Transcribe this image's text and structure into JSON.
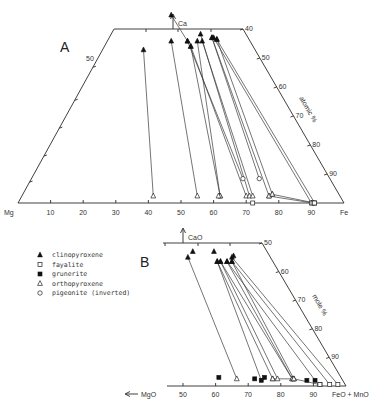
{
  "panelA": {
    "label": "A",
    "apex_label": "Ca",
    "left_label": "Mg",
    "right_label": "Fe",
    "axis_title": "atomic %",
    "bottom_ticks": [
      "10",
      "20",
      "30",
      "40",
      "50",
      "60",
      "70",
      "80",
      "90"
    ],
    "bottom_tick_values": [
      10,
      20,
      30,
      40,
      50,
      60,
      70,
      80,
      90
    ],
    "left_tick_label": "50",
    "right_ticks": [
      "40",
      "50",
      "60",
      "70",
      "80",
      "90"
    ],
    "right_tick_values": [
      40,
      50,
      60,
      70,
      80,
      90
    ],
    "tielines": [
      {
        "from": {
          "type": "clinopyroxene",
          "fe": 38.5,
          "ca": 44
        },
        "to": {
          "type": "orthopyroxene",
          "fe": 41.5,
          "ca": 2
        }
      },
      {
        "from": {
          "type": "clinopyroxene",
          "fe": 47,
          "ca": 46.5
        },
        "to": {
          "type": "orthopyroxene",
          "fe": 55,
          "ca": 2
        }
      },
      {
        "from": {
          "type": "clinopyroxene",
          "fe": 47,
          "ca": 54
        },
        "to": {
          "type": "clinopyroxene",
          "fe": 52,
          "ca": 46.5
        }
      },
      {
        "from": {
          "type": "clinopyroxene",
          "fe": 52,
          "ca": 46.5
        },
        "to": {
          "type": "pigeonite",
          "fe": 69,
          "ca": 7
        }
      },
      {
        "from": {
          "type": "clinopyroxene",
          "fe": 53,
          "ca": 45
        },
        "to": {
          "type": "orthopyroxene",
          "fe": 62,
          "ca": 2
        }
      },
      {
        "from": {
          "type": "clinopyroxene",
          "fe": 53,
          "ca": 45
        },
        "to": {
          "type": "orthopyroxene",
          "fe": 70,
          "ca": 2
        }
      },
      {
        "from": {
          "type": "clinopyroxene",
          "fe": 56,
          "ca": 48.5
        },
        "to": {
          "type": "orthopyroxene",
          "fe": 71,
          "ca": 2
        }
      },
      {
        "from": {
          "type": "clinopyroxene",
          "fe": 55,
          "ca": 46.5
        },
        "to": {
          "type": "orthopyroxene",
          "fe": 62,
          "ca": 2
        }
      },
      {
        "from": {
          "type": "clinopyroxene",
          "fe": 56.5,
          "ca": 46.5
        },
        "to": {
          "type": "orthopyroxene",
          "fe": 72,
          "ca": 2
        }
      },
      {
        "from": {
          "type": "clinopyroxene",
          "fe": 59.5,
          "ca": 47.5
        },
        "to": {
          "type": "pigeonite",
          "fe": 74,
          "ca": 7
        }
      },
      {
        "from": {
          "type": "clinopyroxene",
          "fe": 59.5,
          "ca": 47.5
        },
        "to": {
          "type": "orthopyroxene",
          "fe": 77,
          "ca": 2
        }
      },
      {
        "from": {
          "type": "clinopyroxene",
          "fe": 61,
          "ca": 47
        },
        "to": {
          "type": "orthopyroxene",
          "fe": 78,
          "ca": 2.5
        }
      },
      {
        "from": {
          "type": "clinopyroxene",
          "fe": 61,
          "ca": 47
        },
        "to": {
          "type": "fayalite",
          "fe": 91,
          "ca": 0
        }
      },
      {
        "from": {
          "type": "clinopyroxene",
          "fe": 60,
          "ca": 47.5
        },
        "to": {
          "type": "fayalite",
          "fe": 90,
          "ca": 0
        }
      },
      {
        "from": {
          "type": "orthopyroxene",
          "fe": 77,
          "ca": 2
        },
        "to": {
          "type": "fayalite",
          "fe": 90.5,
          "ca": 0
        }
      },
      {
        "from": {
          "type": "orthopyroxene",
          "fe": 78,
          "ca": 2.5
        },
        "to": {
          "type": "fayalite",
          "fe": 91,
          "ca": 0
        }
      }
    ],
    "extra_points": [
      {
        "type": "orthopyroxene",
        "fe": 61.5,
        "ca": 2
      },
      {
        "type": "fayalite",
        "fe": 72,
        "ca": 0
      }
    ]
  },
  "panelB": {
    "label": "B",
    "apex_label": "CaO",
    "left_label": "MgO",
    "right_label": "FeO + MnO",
    "axis_title": "mole %",
    "bottom_ticks": [
      "50",
      "60",
      "70",
      "80",
      "90"
    ],
    "bottom_tick_values": [
      50,
      60,
      70,
      80,
      90
    ],
    "right_ticks": [
      "50",
      "60",
      "70",
      "80",
      "90"
    ],
    "right_tick_values": [
      50,
      60,
      70,
      80,
      90
    ],
    "tielines": [
      {
        "from": {
          "type": "clinopyroxene",
          "fe": 51.5,
          "ca": 45
        },
        "to": {
          "type": "orthopyroxene",
          "fe": 66.5,
          "ca": 2.5
        }
      },
      {
        "from": {
          "type": "clinopyroxene",
          "fe": 60.5,
          "ca": 43.5
        },
        "to": {
          "type": "grunerite",
          "fe": 74,
          "ca": 2
        }
      },
      {
        "from": {
          "type": "clinopyroxene",
          "fe": 60.5,
          "ca": 43.5
        },
        "to": {
          "type": "orthopyroxene",
          "fe": 77.5,
          "ca": 2.5
        }
      },
      {
        "from": {
          "type": "clinopyroxene",
          "fe": 61.5,
          "ca": 43.5
        },
        "to": {
          "type": "orthopyroxene",
          "fe": 79,
          "ca": 2.5
        }
      },
      {
        "from": {
          "type": "clinopyroxene",
          "fe": 61.5,
          "ca": 43.5
        },
        "to": {
          "type": "orthopyroxene",
          "fe": 83.5,
          "ca": 2.5
        }
      },
      {
        "from": {
          "type": "clinopyroxene",
          "fe": 63.5,
          "ca": 43.5
        },
        "to": {
          "type": "orthopyroxene",
          "fe": 83.5,
          "ca": 2.5
        }
      },
      {
        "from": {
          "type": "clinopyroxene",
          "fe": 63.5,
          "ca": 43.5
        },
        "to": {
          "type": "grunerite",
          "fe": 90.5,
          "ca": 2
        }
      },
      {
        "from": {
          "type": "clinopyroxene",
          "fe": 65,
          "ca": 43.5
        },
        "to": {
          "type": "orthopyroxene",
          "fe": 84,
          "ca": 2.5
        }
      },
      {
        "from": {
          "type": "clinopyroxene",
          "fe": 65,
          "ca": 43.5
        },
        "to": {
          "type": "fayalite",
          "fe": 95,
          "ca": 0.5
        }
      },
      {
        "from": {
          "type": "clinopyroxene",
          "fe": 65,
          "ca": 45
        },
        "to": {
          "type": "fayalite",
          "fe": 97.5,
          "ca": 0.5
        }
      },
      {
        "from": {
          "type": "orthopyroxene",
          "fe": 77.5,
          "ca": 2.5
        },
        "to": {
          "type": "orthopyroxene",
          "fe": 84,
          "ca": 2.5
        }
      },
      {
        "from": {
          "type": "orthopyroxene",
          "fe": 84,
          "ca": 2.5
        },
        "to": {
          "type": "fayalite",
          "fe": 92,
          "ca": 0.5
        }
      }
    ],
    "extra_points": [
      {
        "type": "clinopyroxene",
        "fe": 53,
        "ca": 47
      },
      {
        "type": "clinopyroxene",
        "fe": 59.5,
        "ca": 47
      },
      {
        "type": "clinopyroxene",
        "fe": 65.5,
        "ca": 45.5
      },
      {
        "type": "grunerite",
        "fe": 61,
        "ca": 3
      },
      {
        "type": "grunerite",
        "fe": 72,
        "ca": 2.5
      },
      {
        "type": "grunerite",
        "fe": 75,
        "ca": 3
      },
      {
        "type": "grunerite",
        "fe": 88,
        "ca": 2
      },
      {
        "type": "fayalite",
        "fe": 92,
        "ca": 0.5
      }
    ]
  },
  "legend": [
    {
      "symbol": "filled-triangle",
      "label": "clinopyroxene"
    },
    {
      "symbol": "open-square",
      "label": "fayalite"
    },
    {
      "symbol": "filled-square",
      "label": "grunerite"
    },
    {
      "symbol": "open-triangle",
      "label": "orthopyroxene"
    },
    {
      "symbol": "open-circle",
      "label": "pigeonite (inverted)"
    }
  ]
}
